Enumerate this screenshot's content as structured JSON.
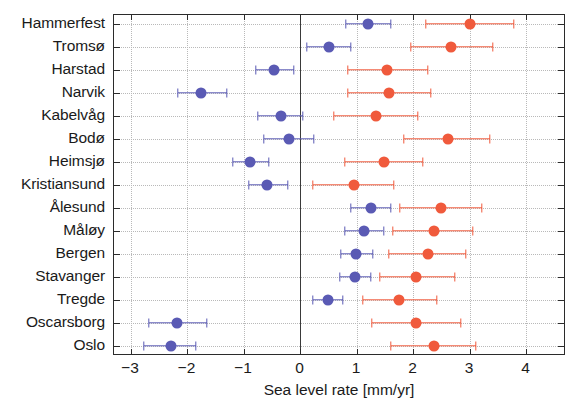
{
  "chart_data": {
    "type": "scatter",
    "orientation": "horizontal",
    "title": "",
    "xlabel": "Sea level rate [mm/yr]",
    "ylabel": "",
    "xlim": [
      -3.3,
      4.7
    ],
    "xticks": [
      -3,
      -2,
      -1,
      0,
      1,
      2,
      3,
      4
    ],
    "xticklabels": [
      "-3",
      "-2",
      "-1",
      "0",
      "1",
      "2",
      "3",
      "4"
    ],
    "grid": true,
    "zero_line": 0,
    "legend": [],
    "categories": [
      "Hammerfest",
      "Tromsø",
      "Harstad",
      "Narvik",
      "Kabelvåg",
      "Bodø",
      "Heimsjø",
      "Kristiansund",
      "Ålesund",
      "Måløy",
      "Bergen",
      "Stavanger",
      "Tregde",
      "Oscarsborg",
      "Oslo"
    ],
    "series": [
      {
        "name": "blue-series",
        "color": "#5a5ab4",
        "values": [
          1.19,
          0.51,
          -0.46,
          -1.76,
          -0.35,
          -0.21,
          -0.89,
          -0.6,
          1.25,
          1.12,
          0.99,
          0.96,
          0.49,
          -2.18,
          -2.29
        ],
        "err_low": [
          0.81,
          0.12,
          -0.79,
          -2.16,
          -0.76,
          -0.64,
          -1.19,
          -0.91,
          0.9,
          0.79,
          0.71,
          0.7,
          0.23,
          -2.68,
          -2.77
        ],
        "err_high": [
          1.6,
          0.9,
          -0.12,
          -1.3,
          0.05,
          0.24,
          -0.55,
          -0.22,
          1.61,
          1.47,
          1.28,
          1.25,
          0.75,
          -1.66,
          -1.84
        ]
      },
      {
        "name": "red-series",
        "color": "#f05a3c",
        "values": [
          3.0,
          2.67,
          1.54,
          1.57,
          1.34,
          2.61,
          1.48,
          0.95,
          2.49,
          2.36,
          2.26,
          2.05,
          1.75,
          2.05,
          2.37
        ],
        "err_low": [
          2.23,
          1.96,
          0.85,
          0.84,
          0.59,
          1.83,
          0.79,
          0.23,
          1.76,
          1.63,
          1.57,
          1.4,
          1.1,
          1.27,
          1.61
        ],
        "err_high": [
          3.78,
          3.41,
          2.26,
          2.31,
          2.08,
          3.36,
          2.17,
          1.66,
          3.21,
          3.06,
          2.93,
          2.74,
          2.42,
          2.84,
          3.11
        ]
      }
    ]
  },
  "axis": {
    "x_title": "Sea level rate [mm/yr]"
  }
}
